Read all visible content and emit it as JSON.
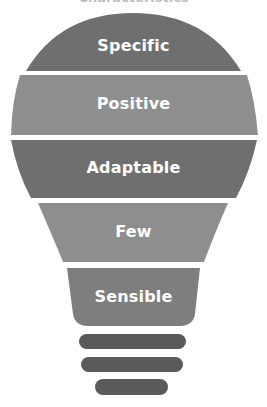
{
  "diagram": {
    "type": "lightbulb-layers",
    "top_cropped_title": "Characteristics",
    "layers": [
      {
        "label": "Specific",
        "color": "#6f6f6f"
      },
      {
        "label": "Positive",
        "color": "#8e8e8e"
      },
      {
        "label": "Adaptable",
        "color": "#6f6f6f"
      },
      {
        "label": "Few",
        "color": "#8e8e8e"
      },
      {
        "label": "Sensible",
        "color": "#7e7e7e"
      }
    ],
    "base_bars": [
      {
        "name": "base-bar-1",
        "color": "#5a5a5a"
      },
      {
        "name": "base-bar-2",
        "color": "#5a5a5a"
      },
      {
        "name": "base-bar-3",
        "color": "#5a5a5a"
      }
    ]
  }
}
